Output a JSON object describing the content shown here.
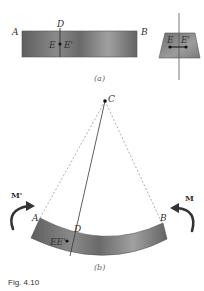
{
  "figure": {
    "caption": "Fig. 4.10",
    "panel_a": {
      "label": "(a)",
      "beam": {
        "left_label": "A",
        "right_label": "B",
        "section_label": "D",
        "point_labels": [
          "E",
          "E'"
        ]
      },
      "cross_section": {
        "point_labels": [
          "E",
          "E'"
        ]
      }
    },
    "panel_b": {
      "label": "(b)",
      "center_label": "C",
      "beam": {
        "left_label": "A",
        "right_label": "B",
        "section_label": "D",
        "point_label": "EE'"
      },
      "moments": {
        "left": "M'",
        "right": "M"
      }
    }
  },
  "colors": {
    "beam_dark": "#5a5a5a",
    "beam_light": "#9a9a9a",
    "line": "#444444",
    "dashed": "#777777"
  }
}
